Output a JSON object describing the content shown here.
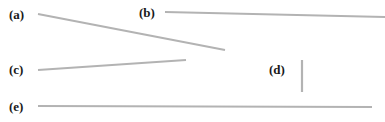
{
  "figure": {
    "width": 385,
    "height": 122,
    "background_color": "#ffffff",
    "line_color": "#b3b3b3",
    "label_color": "#1a1a1a",
    "stroke_width": 2.2
  },
  "labels": {
    "a": "(a)",
    "b": "(b)",
    "c": "(c)",
    "d": "(d)",
    "e": "(e)"
  },
  "chart_data": {
    "type": "diagram",
    "xlabel": "",
    "ylabel": "",
    "xlim": [
      0,
      385
    ],
    "ylim": [
      0,
      122
    ],
    "grid": false,
    "legend": "none",
    "series": [
      {
        "name": "(a)",
        "label": "(a)",
        "kind": "line-segment",
        "orientation": "diagonal-descending",
        "x": [
          38,
          225
        ],
        "y": [
          14,
          50
        ],
        "length_px": 190,
        "angle_deg": 10.9,
        "color": "#b3b3b3",
        "label_x": 9,
        "label_y": 8
      },
      {
        "name": "(b)",
        "label": "(b)",
        "kind": "line-segment",
        "orientation": "near-horizontal",
        "x": [
          165,
          385
        ],
        "y": [
          12,
          17
        ],
        "length_px": 220,
        "angle_deg": 1.3,
        "color": "#b3b3b3",
        "label_x": 139,
        "label_y": 6
      },
      {
        "name": "(c)",
        "label": "(c)",
        "kind": "line-segment",
        "orientation": "near-horizontal-ascending",
        "x": [
          38,
          186
        ],
        "y": [
          70,
          60
        ],
        "length_px": 148,
        "angle_deg": 3.9,
        "color": "#b3b3b3",
        "label_x": 9,
        "label_y": 63
      },
      {
        "name": "(d)",
        "label": "(d)",
        "kind": "line-segment",
        "orientation": "vertical",
        "x": [
          302,
          302
        ],
        "y": [
          60,
          92
        ],
        "length_px": 32,
        "angle_deg": 90,
        "color": "#b3b3b3",
        "label_x": 269,
        "label_y": 63
      },
      {
        "name": "(e)",
        "label": "(e)",
        "kind": "line-segment",
        "orientation": "horizontal",
        "x": [
          38,
          372
        ],
        "y": [
          106,
          107
        ],
        "length_px": 334,
        "angle_deg": 0.2,
        "color": "#b3b3b3",
        "label_x": 9,
        "label_y": 100
      }
    ]
  }
}
